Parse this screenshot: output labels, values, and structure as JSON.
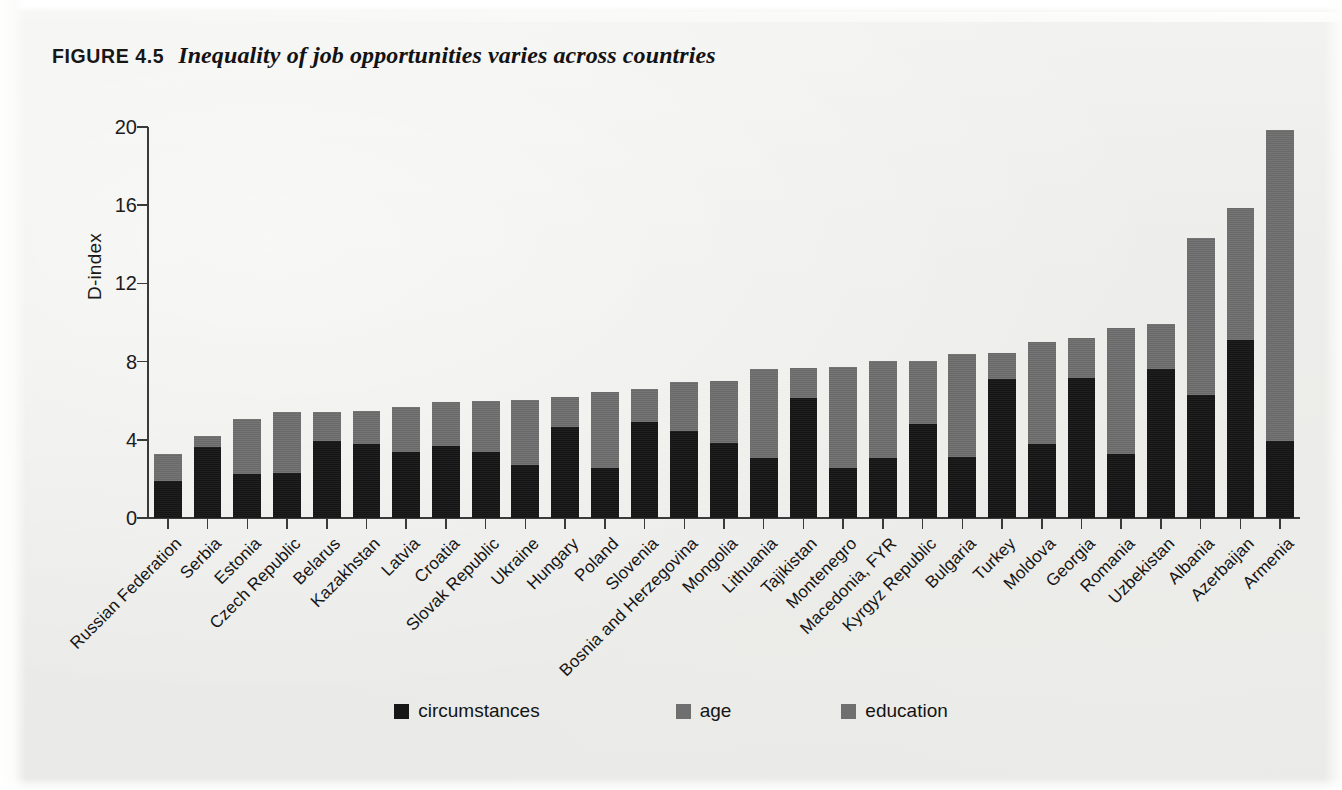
{
  "figure": {
    "label": "FIGURE 4.5",
    "title": "Inequality of job opportunities varies across countries"
  },
  "legend": {
    "items": [
      {
        "label": "circumstances",
        "color": "#171717"
      },
      {
        "label": "age",
        "color": "#6f6f6f"
      },
      {
        "label": "education",
        "color": "#6f6f6f"
      }
    ]
  },
  "chart_data": {
    "type": "bar",
    "stacked": true,
    "title": "Inequality of job opportunities varies across countries",
    "xlabel": "",
    "ylabel": "D-index",
    "ylim": [
      0,
      20
    ],
    "yticks": [
      0,
      4,
      8,
      12,
      16,
      20
    ],
    "ytick_labels": [
      "0",
      "4",
      "8",
      "12",
      "16",
      "20"
    ],
    "grid": false,
    "legend_position": "bottom",
    "categories": [
      "Russian Federation",
      "Serbia",
      "Estonia",
      "Czech Republic",
      "Belarus",
      "Kazakhstan",
      "Latvia",
      "Croatia",
      "Slovak Republic",
      "Ukraine",
      "Hungary",
      "Poland",
      "Slovenia",
      "Bosnia and Herzegovina",
      "Mongolia",
      "Lithuania",
      "Tajikistan",
      "Montenegro",
      "Macedonia, FYR",
      "Kyrgyz Republic",
      "Bulgaria",
      "Turkey",
      "Moldova",
      "Georgia",
      "Romania",
      "Uzbekistan",
      "Albania",
      "Azerbaijan",
      "Armenia"
    ],
    "series": [
      {
        "name": "circumstances",
        "color": "#171717",
        "values": [
          1.9,
          3.65,
          2.25,
          2.3,
          3.95,
          3.8,
          3.4,
          3.7,
          3.4,
          2.7,
          4.65,
          2.55,
          4.9,
          4.45,
          3.85,
          3.05,
          6.15,
          2.55,
          3.05,
          4.8,
          3.1,
          7.1,
          3.8,
          7.15,
          3.3,
          7.6,
          6.3,
          9.1,
          3.95
        ]
      },
      {
        "name": "age + education",
        "color": "#6f6f6f",
        "values": [
          1.4,
          0.55,
          2.8,
          3.1,
          1.45,
          1.65,
          2.3,
          2.25,
          2.6,
          3.35,
          1.55,
          3.9,
          1.7,
          2.5,
          3.15,
          4.55,
          1.5,
          5.2,
          5.0,
          3.25,
          5.3,
          1.35,
          5.2,
          2.05,
          6.4,
          2.3,
          8.0,
          6.75,
          15.9
        ]
      }
    ],
    "totals": [
      3.3,
      4.2,
      5.05,
      5.4,
      5.4,
      5.45,
      5.7,
      5.95,
      6.0,
      6.05,
      6.2,
      6.45,
      6.6,
      6.95,
      7.0,
      7.6,
      7.65,
      7.75,
      8.05,
      8.05,
      8.4,
      8.45,
      9.0,
      9.2,
      9.7,
      9.9,
      14.3,
      15.85,
      19.85
    ]
  }
}
